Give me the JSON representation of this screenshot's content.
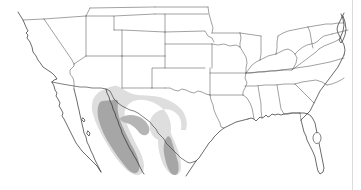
{
  "figure": {
    "region_label": "Southern United States and northern Mexico",
    "background_color": "#ffffff",
    "width_px": 361,
    "height_px": 190
  },
  "legend": {
    "core_range_label": "Core range",
    "peripheral_range_label": "Peripheral range"
  },
  "colors": {
    "core_range": "#a6a6a6",
    "peripheral_range": "#dedede",
    "coastline": "#2b2b2b",
    "state_border": "#555555",
    "international_border": "#3a3a3a",
    "frame": "#d2d2d2",
    "land": "#ffffff"
  },
  "range_polygons": [
    {
      "name": "sierra-madre-occidental-core",
      "level": "core",
      "description": "Narrow north-south band along the Sierra Madre Occidental from southeastern Arizona into western Mexico"
    },
    {
      "name": "sierra-madre-occidental-halo",
      "level": "peripheral",
      "description": "Broad light band surrounding the Sierra Madre Occidental core, widening eastward into Chihuahua"
    },
    {
      "name": "sierra-madre-oriental-core",
      "level": "core",
      "description": "Band in northeastern Mexico south of the lower Rio Grande valley"
    },
    {
      "name": "sierra-madre-oriental-halo",
      "level": "peripheral",
      "description": "Light band surrounding the northeastern Mexico core, extending toward the lower Texas coast"
    }
  ],
  "features": {
    "lakes": [
      {
        "name": "lake-okeechobee"
      }
    ],
    "water_bodies": [
      {
        "name": "gulf-of-california"
      },
      {
        "name": "gulf-of-mexico"
      },
      {
        "name": "pacific-ocean"
      },
      {
        "name": "atlantic-ocean"
      },
      {
        "name": "chesapeake-bay"
      }
    ]
  }
}
